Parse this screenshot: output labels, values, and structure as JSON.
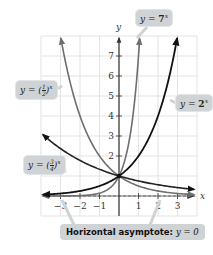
{
  "chart_data": {
    "type": "line",
    "title": "",
    "xlabel": "x",
    "ylabel": "y",
    "xlim": [
      -4,
      4
    ],
    "ylim": [
      -1,
      8
    ],
    "grid": true,
    "x_ticks": [
      "-3",
      "-2",
      "-1",
      "1",
      "2",
      "3"
    ],
    "y_ticks": [
      "2",
      "3",
      "4",
      "5",
      "6",
      "7"
    ],
    "series": [
      {
        "name": "y = 7^x",
        "function": "7^x",
        "color": "#6e6e6e"
      },
      {
        "name": "y = 2^x",
        "function": "2^x",
        "color": "#111111"
      },
      {
        "name": "y = (1/2)^x",
        "function": "0.5^x",
        "color": "#6e6e6e"
      },
      {
        "name": "y = (3/4)^x",
        "function": "0.75^x",
        "color": "#222222"
      }
    ],
    "annotations": [
      "Horizontal asymptote: y = 0"
    ],
    "common_point": [
      0,
      1
    ]
  },
  "labels": {
    "seven": {
      "prefix": "y = ",
      "base": "7",
      "exp": "x"
    },
    "two": {
      "prefix": "y = ",
      "base": "2",
      "exp": "x"
    },
    "half": {
      "prefix": "y = ",
      "num": "1",
      "den": "2",
      "exp": "x"
    },
    "threequarter": {
      "prefix": "y = ",
      "num": "3",
      "den": "4",
      "exp": "x"
    },
    "asymptote": {
      "text": "Horizontal asymptote: ",
      "eq": "y = 0"
    }
  },
  "axes": {
    "x": "x",
    "y": "y"
  }
}
